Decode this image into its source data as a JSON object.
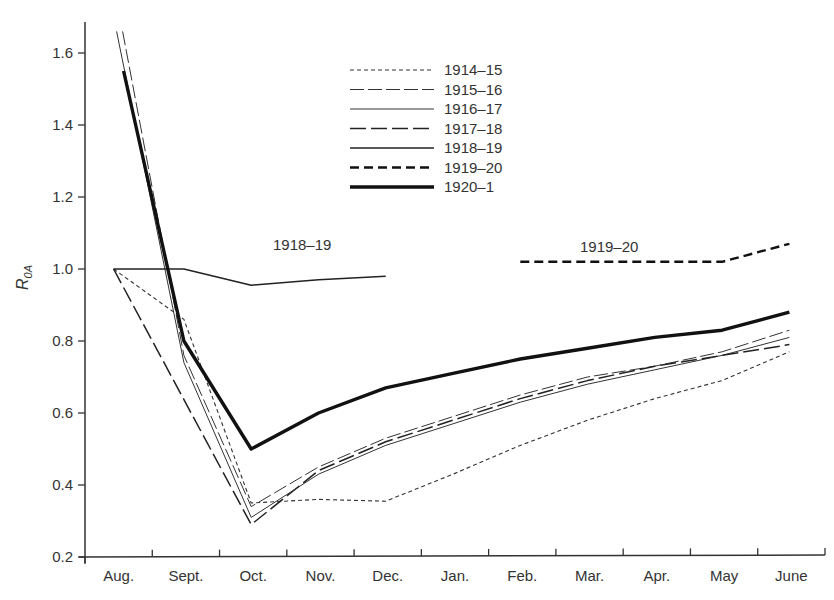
{
  "chart_data": {
    "type": "line",
    "title": "",
    "xlabel": "",
    "ylabel": "R",
    "ylabel_subscript": "0A",
    "ylim": [
      0.2,
      1.7
    ],
    "yticks": [
      0.2,
      0.4,
      0.6,
      0.8,
      1.0,
      1.2,
      1.4,
      1.6
    ],
    "ytick_labels": [
      "0.2",
      "0.4",
      "0.6",
      "0.8",
      "1.0",
      "1.2",
      "1.4",
      "1.6"
    ],
    "categories": [
      "Aug.",
      "Sept.",
      "Oct.",
      "Nov.",
      "Dec.",
      "Jan.",
      "Feb.",
      "Mar.",
      "Apr.",
      "May",
      "June"
    ],
    "grid": false,
    "legend_position": "top-center",
    "series": [
      {
        "name": "1914–15",
        "style": "dotted",
        "color": "#333333",
        "values": [
          1.0,
          0.86,
          0.35,
          0.36,
          0.355,
          0.43,
          0.51,
          0.58,
          0.64,
          0.69,
          0.77
        ]
      },
      {
        "name": "1915–16",
        "style": "long-dash-thin",
        "color": "#333333",
        "values": [
          1.66,
          0.76,
          0.34,
          0.45,
          0.53,
          0.59,
          0.65,
          0.7,
          0.73,
          0.77,
          0.83
        ]
      },
      {
        "name": "1916–17",
        "style": "solid-thin",
        "color": "#333333",
        "values": [
          1.66,
          0.74,
          0.31,
          0.43,
          0.51,
          0.57,
          0.63,
          0.68,
          0.72,
          0.76,
          0.81
        ]
      },
      {
        "name": "1917–18",
        "style": "long-dash",
        "color": "#222222",
        "values": [
          1.0,
          null,
          0.29,
          0.44,
          0.52,
          0.58,
          0.64,
          0.69,
          0.73,
          0.76,
          0.79
        ]
      },
      {
        "name": "1918–19",
        "style": "solid",
        "color": "#222222",
        "values": [
          1.0,
          1.0,
          0.955,
          0.97,
          0.98,
          null,
          null,
          null,
          null,
          null,
          null
        ]
      },
      {
        "name": "1919–20",
        "style": "bold-dash",
        "color": "#111111",
        "values": [
          null,
          null,
          null,
          null,
          null,
          null,
          1.02,
          1.02,
          1.02,
          1.02,
          1.07
        ]
      },
      {
        "name": "1920–1",
        "style": "bold-solid",
        "color": "#111111",
        "values": [
          1.55,
          0.8,
          0.5,
          0.6,
          0.67,
          0.71,
          0.75,
          0.78,
          0.81,
          0.83,
          0.88
        ]
      }
    ],
    "annotations": [
      {
        "text": "1918–19",
        "series": "1918–19"
      },
      {
        "text": "1919–20",
        "series": "1919–20"
      }
    ]
  }
}
